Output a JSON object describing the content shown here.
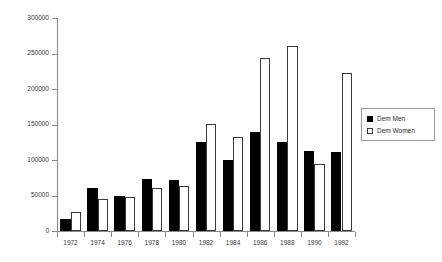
{
  "chart_data": {
    "type": "bar",
    "title": "",
    "subtitle": "",
    "xlabel": "",
    "ylabel": "",
    "categories": [
      "1972",
      "1974",
      "1976",
      "1978",
      "1980",
      "1982",
      "1984",
      "1986",
      "1988",
      "1990",
      "1992"
    ],
    "series": [
      {
        "name": "Dem Men",
        "color": "#000000",
        "values": [
          17000,
          60000,
          49000,
          73000,
          72000,
          125000,
          100000,
          140000,
          126000,
          113000,
          111000
        ]
      },
      {
        "name": "Dem Women",
        "color": "#ffffff",
        "values": [
          27000,
          45000,
          48000,
          60000,
          63000,
          151000,
          133000,
          244000,
          260000,
          95000,
          222000
        ]
      }
    ],
    "ylim": [
      0,
      300000
    ],
    "ytick_labels": [
      "0",
      "50000",
      "100000",
      "150000",
      "200000",
      "250000",
      "300000"
    ],
    "ytick_values": [
      0,
      50000,
      100000,
      150000,
      200000,
      250000,
      300000
    ],
    "grid": false,
    "legend_position": "right"
  },
  "legend": {
    "items": [
      {
        "label": "Dem Men"
      },
      {
        "label": "Dem Women"
      }
    ]
  },
  "axes": {
    "y_axis_name": "value-axis",
    "x_axis_name": "year-axis"
  }
}
